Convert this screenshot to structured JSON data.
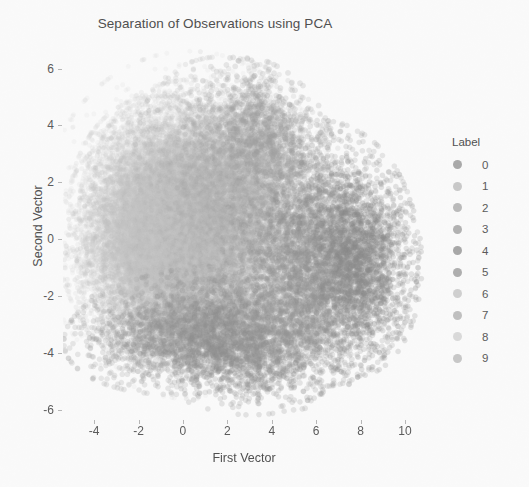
{
  "chart_data": {
    "type": "scatter",
    "title": "Separation of Observations using PCA",
    "xlabel": "First Vector",
    "ylabel": "Second Vector",
    "xlim": [
      -5.4,
      10.9
    ],
    "ylim": [
      -6.6,
      6.9
    ],
    "xticks": [
      -4,
      -2,
      0,
      2,
      4,
      6,
      8,
      10
    ],
    "yticks": [
      6,
      4,
      2,
      0,
      -2,
      -4,
      -6
    ],
    "grid": false,
    "legend": {
      "title": "Label",
      "position": "right",
      "entries": [
        {
          "label": "0",
          "color": "#9c9c9c"
        },
        {
          "label": "1",
          "color": "#c2c2c2"
        },
        {
          "label": "2",
          "color": "#b0b0b0"
        },
        {
          "label": "3",
          "color": "#a6a6a6"
        },
        {
          "label": "4",
          "color": "#9a9a9a"
        },
        {
          "label": "5",
          "color": "#a2a2a2"
        },
        {
          "label": "6",
          "color": "#cacaca"
        },
        {
          "label": "7",
          "color": "#b6b6b6"
        },
        {
          "label": "8",
          "color": "#d6d6d6"
        },
        {
          "label": "9",
          "color": "#c0c0c0"
        }
      ]
    },
    "marker": {
      "shape": "circle",
      "size": 5.2,
      "alpha": 0.16
    },
    "background": "#fdfdfd",
    "n_points_total": 42000,
    "clusters": [
      {
        "label": "1",
        "n": 7200,
        "cx": -0.4,
        "cy": 1.1,
        "sx": 1.65,
        "sy": 1.55,
        "rot": 0.25,
        "color": "#cfcfcf",
        "alpha": 0.13,
        "size": 5.0
      },
      {
        "label": "8",
        "n": 5200,
        "cx": 0.4,
        "cy": 0.2,
        "sx": 1.85,
        "sy": 1.75,
        "rot": -0.15,
        "color": "#d2d2d2",
        "alpha": 0.12,
        "size": 5.0
      },
      {
        "label": "6",
        "n": 4200,
        "cx": -1.1,
        "cy": 0.9,
        "sx": 1.55,
        "sy": 1.6,
        "rot": 0.4,
        "color": "#c6c6c6",
        "alpha": 0.14,
        "size": 5.0
      },
      {
        "label": "2",
        "n": 4600,
        "cx": 0.9,
        "cy": 1.6,
        "sx": 1.9,
        "sy": 1.5,
        "rot": -0.3,
        "color": "#bdbdbd",
        "alpha": 0.14,
        "size": 5.2
      },
      {
        "label": "7",
        "n": 4000,
        "cx": -0.9,
        "cy": -0.6,
        "sx": 1.7,
        "sy": 1.5,
        "rot": 0.2,
        "color": "#bababa",
        "alpha": 0.14,
        "size": 5.2
      },
      {
        "label": "3",
        "n": 3800,
        "cx": 1.6,
        "cy": -0.4,
        "sx": 2.0,
        "sy": 1.5,
        "rot": 0.1,
        "color": "#b0b0b0",
        "alpha": 0.15,
        "size": 5.2
      },
      {
        "label": "9",
        "n": 3400,
        "cx": -1.8,
        "cy": -0.2,
        "sx": 1.45,
        "sy": 1.55,
        "rot": 0.35,
        "color": "#c4c4c4",
        "alpha": 0.14,
        "size": 5.0
      },
      {
        "label": "5",
        "n": 3000,
        "cx": 2.6,
        "cy": 2.3,
        "sx": 1.9,
        "sy": 1.5,
        "rot": -0.45,
        "color": "#ababab",
        "alpha": 0.16,
        "size": 5.4
      },
      {
        "label": "0",
        "n": 3600,
        "cx": 6.2,
        "cy": -0.5,
        "sx": 1.7,
        "sy": 1.8,
        "rot": 0.05,
        "color": "#8f8f8f",
        "alpha": 0.2,
        "size": 5.6
      },
      {
        "label": "0b",
        "n": 1600,
        "cx": 7.9,
        "cy": -0.9,
        "sx": 1.1,
        "sy": 1.5,
        "rot": 0.0,
        "color": "#898989",
        "alpha": 0.22,
        "size": 5.6
      },
      {
        "label": "4",
        "n": 2600,
        "cx": 0.6,
        "cy": -3.2,
        "sx": 2.3,
        "sy": 0.85,
        "rot": 0.08,
        "color": "#949494",
        "alpha": 0.2,
        "size": 5.6
      },
      {
        "label": "4b",
        "n": 1500,
        "cx": 2.4,
        "cy": -3.8,
        "sx": 1.8,
        "sy": 0.9,
        "rot": -0.1,
        "color": "#8d8d8d",
        "alpha": 0.21,
        "size": 5.6
      },
      {
        "label": "rim-tr",
        "n": 900,
        "cx": 3.6,
        "cy": 3.8,
        "sx": 1.3,
        "sy": 0.9,
        "rot": -0.5,
        "color": "#9e9e9e",
        "alpha": 0.22,
        "size": 5.8
      },
      {
        "label": "rim-br",
        "n": 800,
        "cx": 5.0,
        "cy": -2.6,
        "sx": 1.5,
        "sy": 1.3,
        "rot": 0.2,
        "color": "#979797",
        "alpha": 0.22,
        "size": 5.8
      },
      {
        "label": "halo",
        "n": 2600,
        "cx": 0.3,
        "cy": 0.5,
        "sx": 2.6,
        "sy": 2.35,
        "rot": 0.0,
        "color": "#c9c9c9",
        "alpha": 0.1,
        "size": 5.0
      }
    ]
  }
}
